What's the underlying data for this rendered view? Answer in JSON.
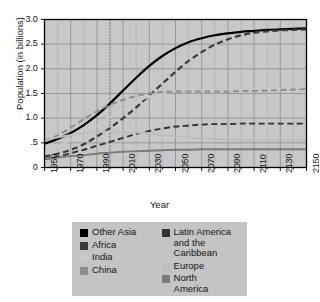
{
  "chart_data": {
    "type": "line",
    "title": "",
    "xlabel": "Year",
    "ylabel": "Population (in billions)",
    "xlim": [
      1950,
      2150
    ],
    "ylim": [
      0,
      3.0
    ],
    "grid": true,
    "legend_position": "bottom",
    "xticklabels": [
      "1950",
      "1970",
      "1990",
      "2010",
      "2030",
      "2050",
      "2070",
      "2090",
      "2110",
      "2130",
      "2150"
    ],
    "xticks": [
      1950,
      1970,
      1990,
      2010,
      2030,
      2050,
      2070,
      2090,
      2110,
      2130,
      2150
    ],
    "yticklabels": [
      "0",
      ".5",
      "1.0",
      "1.5",
      "2.0",
      "2.5",
      "3.0"
    ],
    "yticks": [
      0,
      0.5,
      1.0,
      1.5,
      2.0,
      2.5,
      3.0
    ],
    "annotations": [
      {
        "type": "vertical-dotted-line",
        "x": 2000,
        "label": ""
      }
    ],
    "x": [
      1950,
      1960,
      1970,
      1980,
      1990,
      2000,
      2010,
      2020,
      2030,
      2040,
      2050,
      2060,
      2070,
      2080,
      2090,
      2100,
      2110,
      2120,
      2130,
      2140,
      2150
    ],
    "series": [
      {
        "name": "Other Asia",
        "color": "#000000",
        "style": "solid",
        "values": [
          0.48,
          0.58,
          0.7,
          0.86,
          1.06,
          1.3,
          1.56,
          1.82,
          2.06,
          2.26,
          2.42,
          2.54,
          2.62,
          2.68,
          2.72,
          2.75,
          2.77,
          2.79,
          2.8,
          2.81,
          2.82
        ]
      },
      {
        "name": "Africa",
        "color": "#3a3a3a",
        "style": "dashed",
        "values": [
          0.22,
          0.28,
          0.36,
          0.47,
          0.63,
          0.8,
          1.0,
          1.22,
          1.46,
          1.7,
          1.94,
          2.16,
          2.34,
          2.49,
          2.6,
          2.68,
          2.73,
          2.76,
          2.78,
          2.79,
          2.8
        ]
      },
      {
        "name": "India",
        "color": "#c9c9c9",
        "style": "solid",
        "values": [
          0.36,
          0.44,
          0.55,
          0.69,
          0.85,
          1.02,
          1.18,
          1.32,
          1.44,
          1.51,
          1.55,
          1.56,
          1.56,
          1.56,
          1.57,
          1.57,
          1.58,
          1.58,
          1.59,
          1.59,
          1.6
        ]
      },
      {
        "name": "China",
        "color": "#8c8c8c",
        "style": "dashed",
        "values": [
          0.55,
          0.65,
          0.81,
          0.98,
          1.14,
          1.27,
          1.37,
          1.45,
          1.5,
          1.53,
          1.54,
          1.54,
          1.54,
          1.54,
          1.54,
          1.55,
          1.55,
          1.56,
          1.57,
          1.58,
          1.59
        ]
      },
      {
        "name": "Latin America and the Caribbean",
        "color": "#333333",
        "style": "dashed",
        "values": [
          0.17,
          0.22,
          0.29,
          0.36,
          0.44,
          0.52,
          0.6,
          0.68,
          0.74,
          0.79,
          0.83,
          0.85,
          0.87,
          0.88,
          0.88,
          0.89,
          0.89,
          0.89,
          0.89,
          0.89,
          0.89
        ]
      },
      {
        "name": "Europe",
        "color": "#bdbdbd",
        "style": "solid",
        "values": [
          0.55,
          0.61,
          0.66,
          0.69,
          0.72,
          0.73,
          0.72,
          0.71,
          0.69,
          0.66,
          0.63,
          0.61,
          0.59,
          0.58,
          0.57,
          0.56,
          0.55,
          0.55,
          0.55,
          0.55,
          0.56
        ]
      },
      {
        "name": "North America",
        "color": "#7a7a7a",
        "style": "solid",
        "values": [
          0.17,
          0.2,
          0.23,
          0.25,
          0.28,
          0.3,
          0.32,
          0.33,
          0.34,
          0.35,
          0.36,
          0.36,
          0.37,
          0.37,
          0.37,
          0.37,
          0.37,
          0.37,
          0.37,
          0.37,
          0.37
        ]
      }
    ]
  },
  "legend": {
    "columns": [
      {
        "items": [
          {
            "label": "Other Asia",
            "color": "#000000"
          },
          {
            "label": "Africa",
            "color": "#3a3a3a"
          },
          {
            "label": "India",
            "color": "#c9c9c9"
          },
          {
            "label": "China",
            "color": "#8c8c8c"
          }
        ]
      },
      {
        "items": [
          {
            "label": "Latin America\nand the Caribbean",
            "color": "#333333"
          },
          {
            "label": "Europe",
            "color": "#bdbdbd"
          },
          {
            "label": "North\nAmerica",
            "color": "#7a7a7a"
          }
        ]
      }
    ]
  },
  "theme": {
    "plot_background": "#c8c8c8",
    "grid_color": "#8f8f8f",
    "axis_color": "#000000",
    "legend_background": "#c4c4c4",
    "page_background": "#ffffff",
    "text_color": "#141414"
  }
}
